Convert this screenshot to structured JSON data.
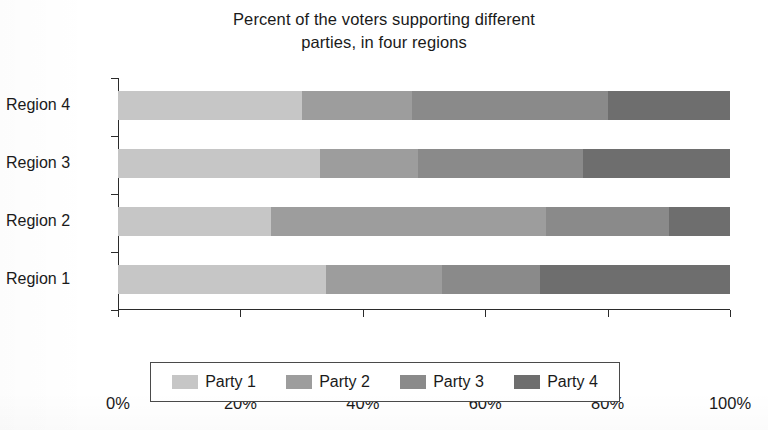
{
  "chart_data": {
    "type": "bar",
    "orientation": "horizontal",
    "stacked": true,
    "normalized": true,
    "title": "Percent of the voters supporting different parties, in four regions",
    "title_line1": "Percent of the voters supporting different",
    "title_line2": "parties, in four regions",
    "xlabel": "",
    "ylabel": "",
    "xlim": [
      0,
      100
    ],
    "grid": false,
    "legend_position": "bottom",
    "categories": [
      "Region 1",
      "Region 2",
      "Region 3",
      "Region 4"
    ],
    "x_ticks": [
      0,
      20,
      40,
      60,
      80,
      100
    ],
    "x_tick_labels": [
      "0%",
      "20%",
      "40%",
      "60%",
      "80%",
      "100%"
    ],
    "series": [
      {
        "name": "Party 1",
        "color": "#c6c6c6",
        "values": [
          34,
          25,
          33,
          30
        ]
      },
      {
        "name": "Party 2",
        "color": "#9d9d9d",
        "values": [
          19,
          45,
          16,
          18
        ]
      },
      {
        "name": "Party 3",
        "color": "#8a8a8a",
        "values": [
          16,
          20,
          27,
          32
        ]
      },
      {
        "name": "Party 4",
        "color": "#6e6e6e",
        "values": [
          31,
          10,
          24,
          20
        ]
      }
    ]
  },
  "legend": {
    "items": [
      {
        "label": "Party 1",
        "color": "#c6c6c6"
      },
      {
        "label": "Party 2",
        "color": "#9d9d9d"
      },
      {
        "label": "Party 3",
        "color": "#8a8a8a"
      },
      {
        "label": "Party 4",
        "color": "#6e6e6e"
      }
    ]
  },
  "axis": {
    "y_labels": [
      "Region 4",
      "Region 3",
      "Region 2",
      "Region 1"
    ],
    "x_labels": [
      "0%",
      "20%",
      "40%",
      "60%",
      "80%",
      "100%"
    ]
  }
}
